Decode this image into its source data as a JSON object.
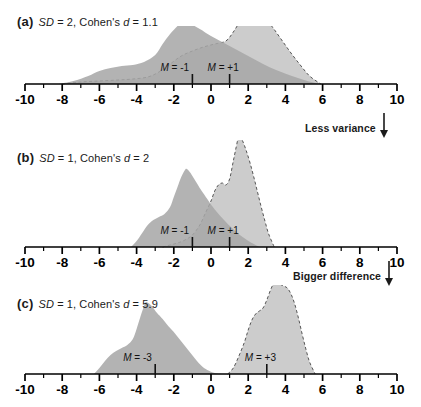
{
  "figure": {
    "axis": {
      "min": -10,
      "max": 10,
      "major_tick_step": 2,
      "minor_tick_step": 1,
      "tick_labels": [
        "-10",
        "-8",
        "-6",
        "-4",
        "-2",
        "0",
        "2",
        "4",
        "6",
        "8",
        "10"
      ],
      "tick_values": [
        -10,
        -8,
        -6,
        -4,
        -2,
        0,
        2,
        4,
        6,
        8,
        10
      ]
    },
    "colors": {
      "dark_fill": "#a6a6a6",
      "light_fill": "#cccccc",
      "overlap_fill": "#9a9a9a",
      "axis": "#000000",
      "text": "#1a1a1a",
      "dashed_outline": "#555555"
    },
    "annotations": [
      {
        "id": "less-variance",
        "text": "Less variance",
        "icon": "down-arrow-icon"
      },
      {
        "id": "bigger-difference",
        "text": "Bigger difference",
        "icon": "down-arrow-icon"
      }
    ]
  },
  "panels": [
    {
      "tag": "(a)",
      "sd_label": "SD",
      "sd_text": " = 2, Cohen's ",
      "d_label": "d",
      "d_text": " = 1.1",
      "sd": 2,
      "cohens_d": 1.1,
      "mean_left_label": "M",
      "mean_left_text": " = -1",
      "mean_right_label": "M",
      "mean_right_text": " = +1",
      "mean_left": -1,
      "mean_right": 1
    },
    {
      "tag": "(b)",
      "sd_label": "SD",
      "sd_text": " = 1, Cohen's ",
      "d_label": "d",
      "d_text": " = 2",
      "sd": 1,
      "cohens_d": 2,
      "mean_left_label": "M",
      "mean_left_text": " = -1",
      "mean_right_label": "M",
      "mean_right_text": " = +1",
      "mean_left": -1,
      "mean_right": 1
    },
    {
      "tag": "(c)",
      "sd_label": "SD",
      "sd_text": " = 1, Cohen's ",
      "d_label": "d",
      "d_text": " = 5.9",
      "sd": 1,
      "cohens_d": 5.9,
      "mean_left_label": "M",
      "mean_left_text": " = -3",
      "mean_right_label": "M",
      "mean_right_text": " = +3",
      "mean_left": -3,
      "mean_right": 3
    }
  ],
  "chart_data": {
    "type": "area",
    "xlabel": "",
    "ylabel": "",
    "xlim": [
      -10,
      10
    ],
    "grid": false,
    "legend": "none",
    "panels": [
      {
        "panel": "a",
        "sd": 2,
        "cohens_d": 1.1,
        "baseline_y": 84,
        "series": [
          {
            "name": "group-1-dark",
            "mean": -1,
            "sd": 2,
            "peak_x": -1.5,
            "peak_height": 62,
            "range": [
              -8.2,
              5.8
            ],
            "style": "solid-fill-dark",
            "profile": [
              [
                -8.2,
                0
              ],
              [
                -7.4,
                3
              ],
              [
                -6.6,
                8
              ],
              [
                -6.0,
                13
              ],
              [
                -5.4,
                16
              ],
              [
                -4.8,
                18
              ],
              [
                -4.2,
                19
              ],
              [
                -3.6,
                22
              ],
              [
                -3.0,
                29
              ],
              [
                -2.6,
                40
              ],
              [
                -2.2,
                50
              ],
              [
                -1.8,
                58
              ],
              [
                -1.5,
                62
              ],
              [
                -1.1,
                60
              ],
              [
                -0.6,
                55
              ],
              [
                0.0,
                48
              ],
              [
                0.7,
                41
              ],
              [
                1.4,
                34
              ],
              [
                2.1,
                27
              ],
              [
                2.8,
                20
              ],
              [
                3.5,
                14
              ],
              [
                4.2,
                9
              ],
              [
                5.0,
                4
              ],
              [
                5.8,
                0
              ]
            ]
          },
          {
            "name": "group-2-light",
            "mean": 1,
            "sd": 2,
            "peak_x": 2.0,
            "peak_height": 76,
            "range": [
              -8.0,
              5.9
            ],
            "style": "dashed-outline-light",
            "profile": [
              [
                -8.0,
                0
              ],
              [
                -7.0,
                2
              ],
              [
                -6.0,
                3
              ],
              [
                -5.0,
                4
              ],
              [
                -4.2,
                5
              ],
              [
                -3.4,
                7
              ],
              [
                -2.8,
                12
              ],
              [
                -2.2,
                20
              ],
              [
                -1.6,
                28
              ],
              [
                -1.0,
                33
              ],
              [
                -0.4,
                37
              ],
              [
                0.2,
                40
              ],
              [
                0.8,
                43
              ],
              [
                1.2,
                52
              ],
              [
                1.6,
                64
              ],
              [
                2.0,
                76
              ],
              [
                2.4,
                74
              ],
              [
                2.8,
                68
              ],
              [
                3.3,
                57
              ],
              [
                3.8,
                44
              ],
              [
                4.3,
                31
              ],
              [
                4.8,
                19
              ],
              [
                5.3,
                8
              ],
              [
                5.9,
                0
              ]
            ]
          }
        ]
      },
      {
        "panel": "b",
        "sd": 1,
        "cohens_d": 2,
        "baseline_y": 107,
        "series": [
          {
            "name": "group-1-dark",
            "mean": -1,
            "sd": 1,
            "peak_x": -1.3,
            "peak_height": 78,
            "range": [
              -4.3,
              2.6
            ],
            "style": "solid-fill-dark",
            "profile": [
              [
                -4.3,
                0
              ],
              [
                -4.0,
                6
              ],
              [
                -3.7,
                14
              ],
              [
                -3.4,
                22
              ],
              [
                -3.1,
                27
              ],
              [
                -2.8,
                30
              ],
              [
                -2.5,
                33
              ],
              [
                -2.2,
                40
              ],
              [
                -2.0,
                50
              ],
              [
                -1.8,
                60
              ],
              [
                -1.6,
                70
              ],
              [
                -1.4,
                77
              ],
              [
                -1.3,
                78
              ],
              [
                -1.1,
                74
              ],
              [
                -0.9,
                68
              ],
              [
                -0.7,
                62
              ],
              [
                -0.5,
                56
              ],
              [
                -0.2,
                48
              ],
              [
                0.1,
                40
              ],
              [
                0.5,
                31
              ],
              [
                0.9,
                23
              ],
              [
                1.3,
                16
              ],
              [
                1.7,
                10
              ],
              [
                2.1,
                5
              ],
              [
                2.6,
                0
              ]
            ]
          },
          {
            "name": "group-2-light",
            "mean": 1,
            "sd": 1,
            "peak_x": 1.5,
            "peak_height": 112,
            "range": [
              -2.6,
              3.4
            ],
            "style": "dashed-outline-light",
            "profile": [
              [
                -2.6,
                0
              ],
              [
                -2.2,
                2
              ],
              [
                -1.8,
                4
              ],
              [
                -1.4,
                7
              ],
              [
                -1.0,
                12
              ],
              [
                -0.6,
                22
              ],
              [
                -0.3,
                34
              ],
              [
                0.0,
                46
              ],
              [
                0.2,
                56
              ],
              [
                0.4,
                62
              ],
              [
                0.6,
                64
              ],
              [
                0.8,
                62
              ],
              [
                1.0,
                68
              ],
              [
                1.2,
                86
              ],
              [
                1.4,
                104
              ],
              [
                1.5,
                112
              ],
              [
                1.7,
                106
              ],
              [
                1.9,
                96
              ],
              [
                2.1,
                84
              ],
              [
                2.3,
                70
              ],
              [
                2.5,
                55
              ],
              [
                2.7,
                40
              ],
              [
                2.9,
                26
              ],
              [
                3.1,
                13
              ],
              [
                3.4,
                0
              ]
            ]
          }
        ]
      },
      {
        "panel": "c",
        "sd": 1,
        "cohens_d": 5.9,
        "baseline_y": 89,
        "series": [
          {
            "name": "group-1-dark",
            "mean": -3,
            "sd": 1,
            "peak_x": -3.5,
            "peak_height": 72,
            "range": [
              -6.3,
              0.6
            ],
            "style": "solid-fill-dark",
            "profile": [
              [
                -6.3,
                0
              ],
              [
                -6.0,
                6
              ],
              [
                -5.7,
                13
              ],
              [
                -5.4,
                19
              ],
              [
                -5.1,
                23
              ],
              [
                -4.8,
                26
              ],
              [
                -4.5,
                29
              ],
              [
                -4.2,
                35
              ],
              [
                -4.0,
                45
              ],
              [
                -3.8,
                57
              ],
              [
                -3.6,
                68
              ],
              [
                -3.5,
                72
              ],
              [
                -3.3,
                70
              ],
              [
                -3.1,
                66
              ],
              [
                -2.9,
                61
              ],
              [
                -2.6,
                55
              ],
              [
                -2.3,
                48
              ],
              [
                -2.0,
                42
              ],
              [
                -1.7,
                35
              ],
              [
                -1.4,
                28
              ],
              [
                -1.1,
                21
              ],
              [
                -0.8,
                14
              ],
              [
                -0.5,
                8
              ],
              [
                -0.2,
                4
              ],
              [
                0.2,
                1
              ],
              [
                0.6,
                0
              ]
            ]
          },
          {
            "name": "group-2-light",
            "mean": 3,
            "sd": 1,
            "peak_x": 3.5,
            "peak_height": 94,
            "range": [
              0.9,
              5.6
            ],
            "style": "dashed-outline-light",
            "profile": [
              [
                0.9,
                0
              ],
              [
                1.2,
                6
              ],
              [
                1.5,
                18
              ],
              [
                1.8,
                32
              ],
              [
                2.0,
                44
              ],
              [
                2.2,
                54
              ],
              [
                2.4,
                60
              ],
              [
                2.6,
                63
              ],
              [
                2.8,
                66
              ],
              [
                3.0,
                74
              ],
              [
                3.2,
                84
              ],
              [
                3.4,
                92
              ],
              [
                3.5,
                94
              ],
              [
                3.7,
                90
              ],
              [
                3.9,
                88
              ],
              [
                4.1,
                86
              ],
              [
                4.3,
                80
              ],
              [
                4.5,
                70
              ],
              [
                4.7,
                56
              ],
              [
                4.9,
                40
              ],
              [
                5.1,
                25
              ],
              [
                5.3,
                12
              ],
              [
                5.6,
                0
              ]
            ]
          }
        ]
      }
    ]
  }
}
